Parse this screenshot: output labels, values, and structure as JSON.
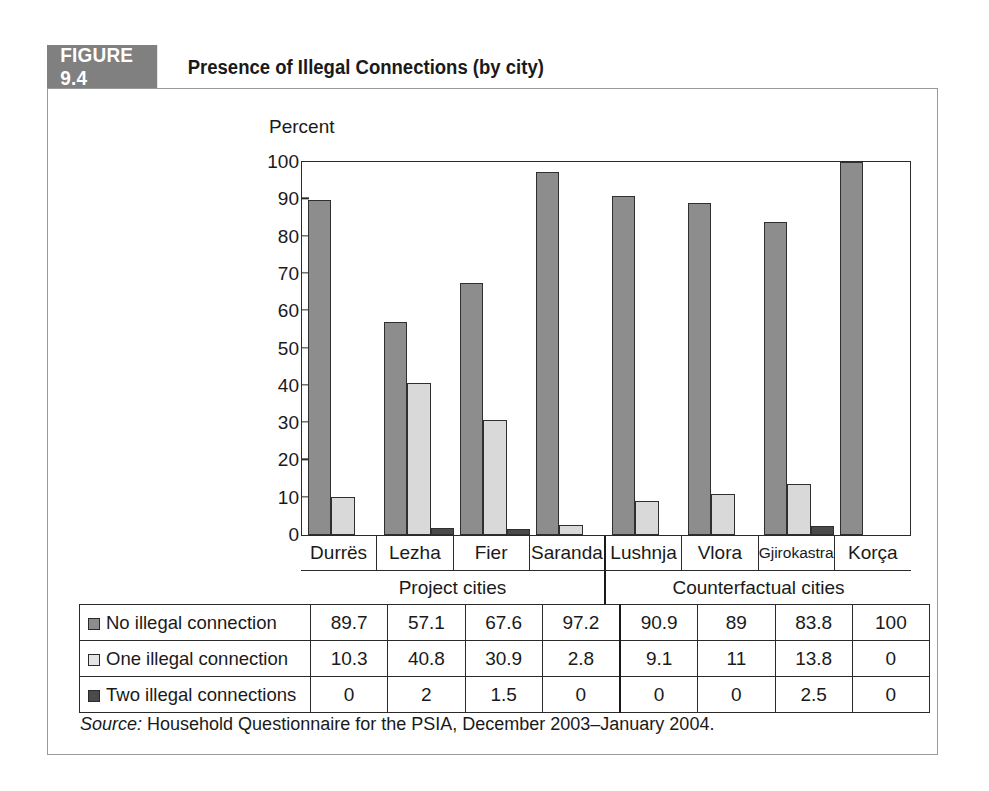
{
  "figure": {
    "tag": "FIGURE 9.4",
    "title": "Presence of Illegal Connections (by city)",
    "source_word": "Source:",
    "source_text": " Household Questionnaire for the PSIA, December 2003–January 2004."
  },
  "chart_data": {
    "type": "bar",
    "title": "Presence of Illegal Connections (by city)",
    "xlabel": "",
    "ylabel": "Percent",
    "ylim": [
      0,
      100
    ],
    "ytick_step": 10,
    "yticks": [
      "100",
      "90",
      "80",
      "70",
      "60",
      "50",
      "40",
      "30",
      "20",
      "10",
      "0"
    ],
    "grid": false,
    "legend_position": "table-row-labels",
    "categories": [
      "Durrës",
      "Lezha",
      "Fier",
      "Saranda",
      "Lushnja",
      "Vlora",
      "Gjirokastra",
      "Korça"
    ],
    "groups": [
      {
        "name": "Project cities",
        "categories": [
          "Durrës",
          "Lezha",
          "Fier",
          "Saranda"
        ]
      },
      {
        "name": "Counterfactual cities",
        "categories": [
          "Lushnja",
          "Vlora",
          "Gjirokastra",
          "Korça"
        ]
      }
    ],
    "series": [
      {
        "name": "No illegal connection",
        "color": "#8d8d8d",
        "values": [
          89.7,
          57.1,
          67.6,
          97.2,
          90.9,
          89,
          83.8,
          100
        ]
      },
      {
        "name": "One illegal connection",
        "color": "#d9d9d9",
        "values": [
          10.3,
          40.8,
          30.9,
          2.8,
          9.1,
          11,
          13.8,
          0
        ]
      },
      {
        "name": "Two illegal connections",
        "color": "#4a4a4a",
        "values": [
          0,
          2,
          1.5,
          0,
          0,
          0,
          2.5,
          0
        ]
      }
    ],
    "table": {
      "rows": [
        {
          "label": "No illegal connection",
          "swatch": "s0",
          "cells": [
            "89.7",
            "57.1",
            "67.6",
            "97.2",
            "90.9",
            "89",
            "83.8",
            "100"
          ]
        },
        {
          "label": "One illegal connection",
          "swatch": "s1",
          "cells": [
            "10.3",
            "40.8",
            "30.9",
            "2.8",
            "9.1",
            "11",
            "13.8",
            "0"
          ]
        },
        {
          "label": "Two illegal connections",
          "swatch": "s2",
          "cells": [
            "0",
            "2",
            "1.5",
            "0",
            "0",
            "0",
            "2.5",
            "0"
          ]
        }
      ]
    }
  }
}
